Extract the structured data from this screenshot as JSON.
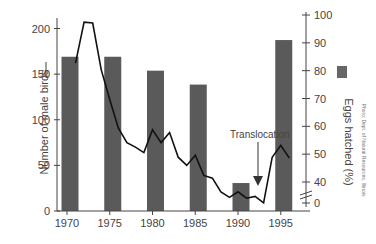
{
  "chart_data": {
    "type": "bar+line",
    "title": "",
    "xlabel": "",
    "x_ticks": [
      "1970",
      "1975",
      "1980",
      "1985",
      "1990",
      "1995"
    ],
    "series": [
      {
        "name": "Number of male birds",
        "type": "line",
        "axis": "left",
        "x": [
          1971,
          1972,
          1973,
          1974,
          1975,
          1976,
          1977,
          1978,
          1979,
          1980,
          1981,
          1982,
          1983,
          1984,
          1985,
          1986,
          1987,
          1988,
          1989,
          1990,
          1991,
          1992,
          1993,
          1994,
          1995,
          1996
        ],
        "values": [
          162,
          207,
          206,
          155,
          122,
          91,
          75,
          70,
          64,
          89,
          75,
          86,
          59,
          50,
          61,
          39,
          36,
          21,
          15,
          21,
          14,
          16,
          9,
          59,
          72,
          58
        ]
      },
      {
        "name": "Eggs hatched (%)",
        "type": "bar",
        "axis": "right",
        "x": [
          1970,
          1975,
          1980,
          1985,
          1990,
          1995
        ],
        "values": [
          85,
          85,
          80,
          75,
          38,
          91
        ]
      }
    ],
    "ylabel_left": "Number of male birds",
    "ylabel_right": "Eggs hatched (%)",
    "ylim_left": [
      0,
      210
    ],
    "yticks_left": [
      0,
      50,
      100,
      150,
      200
    ],
    "ylim_right": [
      0,
      100
    ],
    "yticks_right": [
      0,
      40,
      50,
      60,
      70,
      80,
      90,
      100
    ],
    "right_axis_break": true,
    "annotations": [
      {
        "text": "Translocation",
        "x": 1993,
        "arrow": true
      }
    ],
    "grid": false
  },
  "labels": {
    "ylabel_left": "Number of male birds",
    "ylabel_right": "Eggs hatched (%)",
    "annotation": "Translocation",
    "credit": "Photo: Dept. of Natural Resources, Illinois"
  }
}
